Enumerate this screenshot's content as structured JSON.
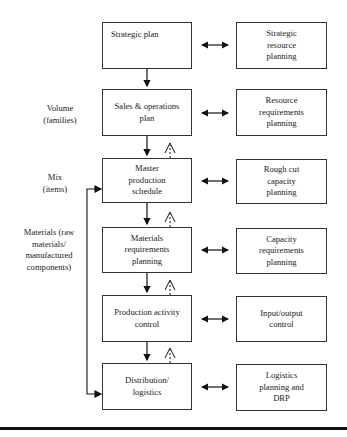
{
  "main_column": [
    {
      "id": "strategic-plan",
      "label": "Strategic plan"
    },
    {
      "id": "sales-operations-plan",
      "label": "Sales & operations plan"
    },
    {
      "id": "master-production-schedule",
      "label": "Master production schedule"
    },
    {
      "id": "materials-requirements-planning",
      "label": "Materials requirements planning"
    },
    {
      "id": "production-activity-control",
      "label": "Production activity control"
    },
    {
      "id": "distribution-logistics",
      "label": "Distribution/ logistics"
    }
  ],
  "resource_column": [
    {
      "id": "strategic-resource-planning",
      "label": "Strategic resource planning"
    },
    {
      "id": "resource-requirements-planning",
      "label": "Resource requirements planning"
    },
    {
      "id": "rough-cut-capacity-planning",
      "label": "Rough cut capacity planning"
    },
    {
      "id": "capacity-requirements-planning",
      "label": "Capacity requirements planning"
    },
    {
      "id": "input-output-control",
      "label": "Input/output control"
    },
    {
      "id": "logistics-planning-drp",
      "label": "Logistics planning and DRP"
    }
  ],
  "side_labels": {
    "volume": "Volume (families)",
    "mix": "Mix (items)",
    "materials": "Materials (raw materials/ manufactured components)"
  },
  "arrows": {
    "bidirectional": "Each planning level links both ways with its resource/capacity check",
    "downward": "Solid arrows down between consecutive planning levels",
    "feedback": "Dashed upward feedback arrows between levels",
    "materials_bracket": "Bracket from Master production schedule down to Distribution/logistics"
  }
}
